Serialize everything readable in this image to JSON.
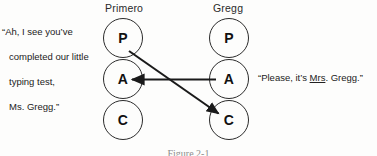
{
  "figure": {
    "label": "Figure 2-1",
    "columns": [
      {
        "name": "primero",
        "header": "Primero"
      },
      {
        "name": "gregg",
        "header": "Gregg"
      }
    ],
    "ego_states": {
      "parent": "P",
      "adult": "A",
      "child": "C"
    },
    "circles": [
      {
        "column": "Primero",
        "state": "P"
      },
      {
        "column": "Primero",
        "state": "A"
      },
      {
        "column": "Primero",
        "state": "C"
      },
      {
        "column": "Gregg",
        "state": "P"
      },
      {
        "column": "Gregg",
        "state": "A"
      },
      {
        "column": "Gregg",
        "state": "C"
      }
    ],
    "arrows": [
      {
        "name": "crossed-transaction-arrow",
        "from": "Primero P",
        "to": "Gregg C",
        "style": "solid",
        "color": "#1a1a1a"
      },
      {
        "name": "adult-to-adult-arrow",
        "from": "Gregg A",
        "to": "Primero A",
        "style": "solid",
        "color": "#1a1a1a"
      }
    ]
  },
  "captions": {
    "left": {
      "line1": "“Ah, I see you’ve",
      "line2": "completed our little",
      "line3": "typing test,",
      "line4": "Ms. Gregg.”"
    },
    "right": {
      "before": "“Please, it’s ",
      "underlined": "Mrs",
      "after": ". Gregg.”"
    }
  },
  "colors": {
    "ink": "#1a1a1a",
    "stroke": "#2b2b2b",
    "background": "#fdfdfc"
  }
}
